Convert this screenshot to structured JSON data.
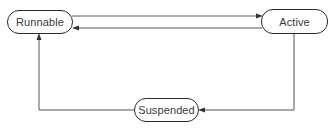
{
  "diagram": {
    "type": "state-transition",
    "nodes": [
      {
        "id": "runnable",
        "label": "Runnable"
      },
      {
        "id": "active",
        "label": "Active"
      },
      {
        "id": "suspended",
        "label": "Suspended"
      }
    ],
    "edges": [
      {
        "from": "runnable",
        "to": "active"
      },
      {
        "from": "active",
        "to": "runnable"
      },
      {
        "from": "active",
        "to": "suspended"
      },
      {
        "from": "suspended",
        "to": "runnable"
      }
    ],
    "colors": {
      "line": "#555555",
      "node_border": "#2a2a2a",
      "text": "#3a3a3a",
      "background": "#ffffff"
    }
  }
}
